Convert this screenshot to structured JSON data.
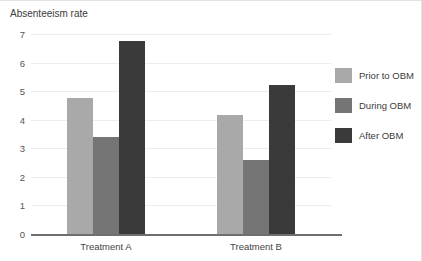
{
  "chart_data": {
    "type": "bar",
    "title": "Absenteeism rate",
    "xlabel": "",
    "ylabel": "",
    "categories": [
      "Treatment A",
      "Treatment B"
    ],
    "series": [
      {
        "name": "Prior to OBM",
        "color": "#a9a9a9",
        "values": [
          4.75,
          4.15
        ]
      },
      {
        "name": "During OBM",
        "color": "#757575",
        "values": [
          3.4,
          2.6
        ]
      },
      {
        "name": "After OBM",
        "color": "#3a3a3a",
        "values": [
          6.75,
          5.2
        ]
      }
    ],
    "ylim": [
      0,
      7
    ],
    "yticks": [
      0,
      1,
      2,
      3,
      4,
      5,
      6,
      7
    ],
    "ytick_labels": [
      "0",
      "1",
      "2",
      "3",
      "4",
      "5",
      "6",
      "7"
    ],
    "grid": true,
    "legend_position": "right"
  }
}
